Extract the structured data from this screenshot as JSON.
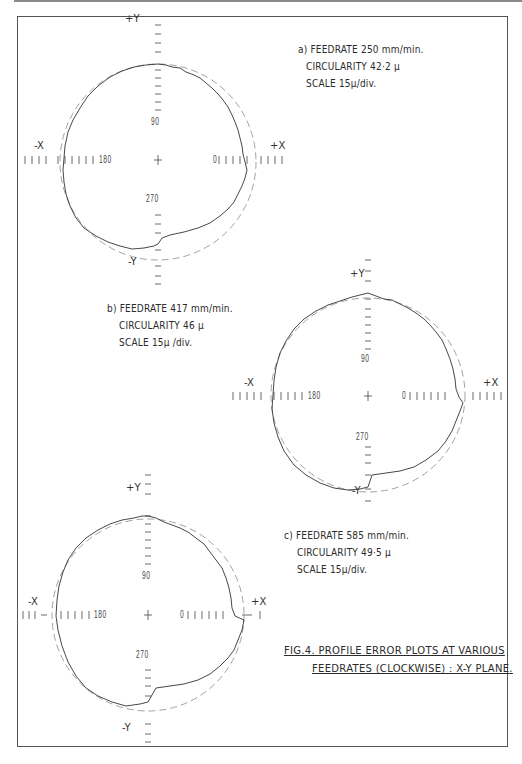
{
  "document": {
    "figure_caption": {
      "line1": "FIG.4.  PROFILE  ERROR  PLOTS  AT  VARIOUS",
      "line2": "FEEDRATES  (CLOCKWISE) : X-Y PLANE."
    }
  },
  "plots": [
    {
      "id": "a",
      "label_line1": "a) FEEDRATE 250  mm/min.",
      "label_line2": "CIRCULARITY 42·2 µ",
      "label_line3": "SCALE 15µ/div.",
      "axes": {
        "pos_y": "+Y",
        "neg_y": "-Y",
        "pos_x": "+X",
        "neg_x": "-X"
      },
      "angles": {
        "deg0": "0",
        "deg90": "90",
        "deg180": "180",
        "deg270": "270"
      }
    },
    {
      "id": "b",
      "label_line1": "b) FEEDRATE 417 mm/min.",
      "label_line2": "CIRCULARITY  46 µ",
      "label_line3": "SCALE 15µ /div.",
      "axes": {
        "pos_y": "+Y",
        "neg_y": "-Y",
        "pos_x": "+X",
        "neg_x": "-X"
      },
      "angles": {
        "deg0": "0",
        "deg90": "90",
        "deg180": "180",
        "deg270": "270"
      }
    },
    {
      "id": "c",
      "label_line1": "c) FEEDRATE 585 mm/min.",
      "label_line2": "CIRCULARITY 49·5 µ",
      "label_line3": "SCALE 15µ/div.",
      "axes": {
        "pos_y": "+Y",
        "neg_y": "-Y",
        "pos_x": "+X",
        "neg_x": "-X"
      },
      "angles": {
        "deg0": "0",
        "deg90": "90",
        "deg180": "180",
        "deg270": "270"
      }
    }
  ],
  "colors": {
    "ink": "#2b2b2b",
    "reference_circle": "#8a8a8a",
    "frame": "#555555"
  }
}
